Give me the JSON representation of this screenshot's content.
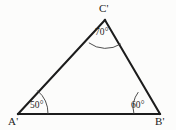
{
  "figure": {
    "type": "triangle-diagram",
    "background_color": "#fcfcfb",
    "line_color": "#1c1c1c",
    "arc_color": "#3a3a3a",
    "vertices": [
      {
        "id": "A",
        "label": "A'",
        "x": 18,
        "y": 114
      },
      {
        "id": "B",
        "label": "B'",
        "x": 160,
        "y": 114
      },
      {
        "id": "C",
        "label": "C'",
        "x": 105,
        "y": 20
      }
    ],
    "angles": [
      {
        "at": "A",
        "label": "50°",
        "value": 50,
        "arc_radius": 30
      },
      {
        "at": "B",
        "label": "60°",
        "value": 60,
        "arc_radius": 26
      },
      {
        "at": "C",
        "label": "70°",
        "value": 70,
        "arc_radius": 28
      }
    ],
    "edges": [
      {
        "from": "A",
        "to": "B",
        "name": "base-side"
      },
      {
        "from": "A",
        "to": "C",
        "name": "left-side"
      },
      {
        "from": "B",
        "to": "C",
        "name": "right-side"
      }
    ]
  }
}
